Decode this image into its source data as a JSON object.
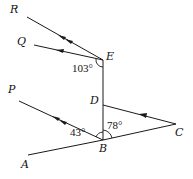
{
  "diagram": {
    "type": "geometry-parallel-lines",
    "points": {
      "R": {
        "label": "R",
        "x": 20,
        "y": 13
      },
      "Q": {
        "label": "Q",
        "x": 27,
        "y": 43
      },
      "E": {
        "label": "E",
        "x": 103,
        "y": 60
      },
      "P": {
        "label": "P",
        "x": 12,
        "y": 98
      },
      "D": {
        "label": "D",
        "x": 103,
        "y": 104
      },
      "B": {
        "label": "B",
        "x": 103,
        "y": 140
      },
      "A": {
        "label": "A",
        "x": 27,
        "y": 157
      },
      "C": {
        "label": "C",
        "x": 177,
        "y": 125
      }
    },
    "angles": {
      "angle_E": "103°",
      "angle_B_left": "43°",
      "angle_B_right": "78°"
    },
    "segments": [
      "ER",
      "EQ",
      "ED",
      "DB",
      "BP",
      "BA",
      "BC",
      "DC"
    ],
    "parallel_markings": {
      "double_arrow": [
        "ER",
        "BP"
      ],
      "single_arrow": [
        "EQ",
        "DC"
      ]
    },
    "stroke_color": "#1a1a1a"
  }
}
